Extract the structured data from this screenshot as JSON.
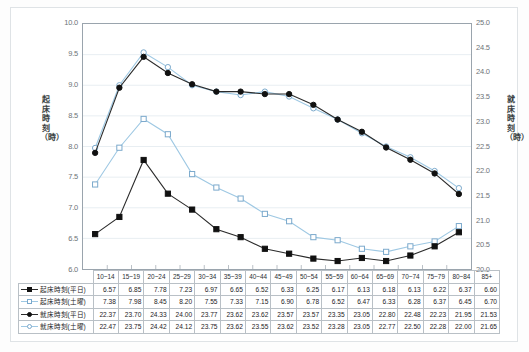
{
  "chart_data": {
    "type": "line",
    "title": "",
    "xlabel": "",
    "ylabel": "起床時刻（時）",
    "ylabel_right": "就床時刻（時）",
    "grid": true,
    "legend_position": "table-left",
    "ylim": [
      6.0,
      10.0
    ],
    "ylim_right": [
      20.0,
      25.0
    ],
    "yticks": [
      "10.0",
      "9.5",
      "9.0",
      "8.5",
      "8.0",
      "7.5",
      "7.0",
      "6.5",
      "6.0"
    ],
    "yticks_right": [
      "25.0",
      "24.5",
      "24.0",
      "23.5",
      "23.0",
      "22.5",
      "22.0",
      "21.5",
      "21.0",
      "20.5",
      "20.0"
    ],
    "categories": [
      "10~14",
      "15~19",
      "20~24",
      "25~29",
      "30~34",
      "35~39",
      "40~44",
      "45~49",
      "50~54",
      "55~59",
      "60~64",
      "65~69",
      "70~74",
      "75~79",
      "80~84",
      "85+"
    ],
    "series": [
      {
        "name": "起床時刻(平日)",
        "axis": "left",
        "marker": "square-filled",
        "color": "#2b2b2b",
        "values": [
          6.57,
          6.85,
          7.78,
          7.23,
          6.97,
          6.65,
          6.52,
          6.33,
          6.25,
          6.17,
          6.13,
          6.18,
          6.13,
          6.22,
          6.37,
          6.6
        ]
      },
      {
        "name": "起床時刻(土曜)",
        "axis": "left",
        "marker": "square-open",
        "color": "#9ec8e3",
        "values": [
          7.38,
          7.98,
          8.45,
          8.2,
          7.55,
          7.33,
          7.15,
          6.9,
          6.78,
          6.52,
          6.47,
          6.33,
          6.28,
          6.37,
          6.45,
          6.7
        ]
      },
      {
        "name": "就床時刻(平日)",
        "axis": "right",
        "marker": "circle-filled",
        "color": "#2b2b2b",
        "values": [
          22.37,
          23.7,
          24.33,
          24.0,
          23.77,
          23.62,
          23.62,
          23.57,
          23.57,
          23.35,
          23.05,
          22.8,
          22.48,
          22.23,
          21.95,
          21.53
        ]
      },
      {
        "name": "就床時刻(土曜)",
        "axis": "right",
        "marker": "circle-open",
        "color": "#9ec8e3",
        "values": [
          22.47,
          23.75,
          24.42,
          24.12,
          23.75,
          23.62,
          23.55,
          23.62,
          23.52,
          23.28,
          23.05,
          22.77,
          22.5,
          22.28,
          22.0,
          21.65
        ]
      }
    ]
  },
  "table": {
    "corner": "",
    "headers": [
      "10~14",
      "15~19",
      "20~24",
      "25~29",
      "30~34",
      "35~39",
      "40~44",
      "45~49",
      "50~54",
      "55~59",
      "60~64",
      "65~69",
      "70~74",
      "75~79",
      "80~84",
      "85+"
    ],
    "rows": [
      {
        "label": "起床時刻(平日)",
        "marker": "square-filled",
        "line": "dark",
        "values": [
          "6.57",
          "6.85",
          "7.78",
          "7.23",
          "6.97",
          "6.65",
          "6.52",
          "6.33",
          "6.25",
          "6.17",
          "6.13",
          "6.18",
          "6.13",
          "6.22",
          "6.37",
          "6.60"
        ]
      },
      {
        "label": "起床時刻(土曜)",
        "marker": "square-open",
        "line": "light",
        "values": [
          "7.38",
          "7.98",
          "8.45",
          "8.20",
          "7.55",
          "7.33",
          "7.15",
          "6.90",
          "6.78",
          "6.52",
          "6.47",
          "6.33",
          "6.28",
          "6.37",
          "6.45",
          "6.70"
        ]
      },
      {
        "label": "就床時刻(平日)",
        "marker": "circle-filled",
        "line": "dark",
        "values": [
          "22.37",
          "23.70",
          "24.33",
          "24.00",
          "23.77",
          "23.62",
          "23.62",
          "23.57",
          "23.57",
          "23.35",
          "23.05",
          "22.80",
          "22.48",
          "22.23",
          "21.95",
          "21.53"
        ]
      },
      {
        "label": "就床時刻(土曜)",
        "marker": "circle-open",
        "line": "light",
        "values": [
          "22.47",
          "23.75",
          "24.42",
          "24.12",
          "23.75",
          "23.62",
          "23.55",
          "23.62",
          "23.52",
          "23.28",
          "23.05",
          "22.77",
          "22.50",
          "22.28",
          "22.00",
          "21.65"
        ]
      }
    ]
  },
  "colors": {
    "dark_series": "#2b2b2b",
    "light_series": "#9ec8e3",
    "grid": "#e8eef2",
    "axis": "#9aa4ad",
    "frame": "#dfe3e6"
  }
}
